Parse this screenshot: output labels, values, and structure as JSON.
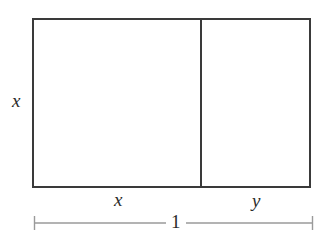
{
  "figure": {
    "type": "geometry-diagram",
    "background_color": "#ffffff",
    "stroke_color": "#3a3a3a",
    "dimension_stroke_color": "#8a8a8a",
    "text_color": "#2b2b2b",
    "outer_rectangle": {
      "left": 33,
      "top": 19,
      "right": 310,
      "bottom": 187,
      "stroke_width": 2
    },
    "divider_line": {
      "x": 201,
      "top": 19,
      "bottom": 187,
      "stroke_width": 2
    },
    "dimension_line": {
      "y": 223,
      "left": 34,
      "right": 313,
      "tick_half_height": 7,
      "stroke_width": 1
    },
    "labels": {
      "height_left": "x",
      "width_left": "x",
      "width_right": "y",
      "total_width": "1"
    }
  }
}
